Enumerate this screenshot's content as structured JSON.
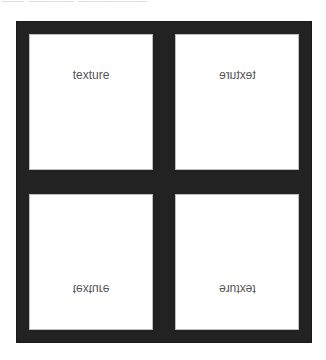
{
  "caption": {
    "fragment": "—— ———— ——————"
  },
  "colors": {
    "frame": "#222222",
    "panel": "#ffffff",
    "label": "#555555"
  },
  "panels": [
    {
      "position": "top-left",
      "label": "texture",
      "orientation": "normal"
    },
    {
      "position": "top-right",
      "label": "texture",
      "orientation": "mirrored-horizontal"
    },
    {
      "position": "bottom-left",
      "label": "texture",
      "orientation": "flipped-vertical"
    },
    {
      "position": "bottom-right",
      "label": "texture",
      "orientation": "rotated-180"
    }
  ]
}
